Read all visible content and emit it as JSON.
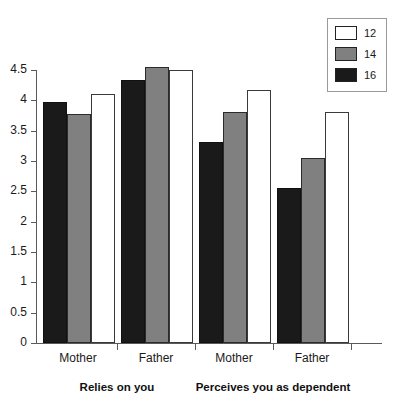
{
  "chart_data": {
    "type": "bar",
    "title": "",
    "subtitle": "",
    "xlabel": "",
    "ylabel": "",
    "ylim": [
      0,
      4.5
    ],
    "grid": false,
    "legend_position": "top-right",
    "legend_title": "",
    "categories": [
      "Mother",
      "Father",
      "Mother",
      "Father"
    ],
    "group_labels": [
      "Relies on you",
      "Perceives you as dependent"
    ],
    "group_spans": [
      2,
      2
    ],
    "yticks": [
      "0",
      "0.5",
      "1",
      "1.5",
      "2",
      "2.5",
      "3",
      "3.5",
      "4",
      "4.5"
    ],
    "ytick_values": [
      0,
      0.5,
      1,
      1.5,
      2,
      2.5,
      3,
      3.5,
      4,
      4.5
    ],
    "series": [
      {
        "name": "16",
        "color": "#1a1a1a",
        "values": [
          3.97,
          4.33,
          3.32,
          2.55
        ]
      },
      {
        "name": "14",
        "color": "#808080",
        "values": [
          3.77,
          4.55,
          3.8,
          3.05
        ]
      },
      {
        "name": "12",
        "color": "#ffffff",
        "values": [
          4.1,
          4.5,
          4.17,
          3.8
        ]
      }
    ],
    "series_draw_order": [
      "16",
      "14",
      "12"
    ]
  },
  "legend": {
    "entries": [
      {
        "label": "12",
        "color": "#ffffff"
      },
      {
        "label": "14",
        "color": "#808080"
      },
      {
        "label": "16",
        "color": "#1a1a1a"
      }
    ]
  },
  "axis": {
    "y_ticks": [
      {
        "label": "4.5",
        "value": 4.5
      },
      {
        "label": "4",
        "value": 4
      },
      {
        "label": "3.5",
        "value": 3.5
      },
      {
        "label": "3",
        "value": 3
      },
      {
        "label": "2.5",
        "value": 2.5
      },
      {
        "label": "2",
        "value": 2
      },
      {
        "label": "1.5",
        "value": 1.5
      },
      {
        "label": "1",
        "value": 1
      },
      {
        "label": "0.5",
        "value": 0.5
      },
      {
        "label": "0",
        "value": 0
      }
    ]
  },
  "categories": [
    {
      "label": "Mother"
    },
    {
      "label": "Father"
    },
    {
      "label": "Mother"
    },
    {
      "label": "Father"
    }
  ],
  "group_labels": [
    {
      "label": "Relies on you"
    },
    {
      "label": "Perceives you as dependent"
    }
  ],
  "colors": {
    "series_12": "#ffffff",
    "series_14": "#808080",
    "series_16": "#1a1a1a",
    "axis": "#5a5a5a",
    "text": "#1a1a1a",
    "background": "#ffffff"
  }
}
